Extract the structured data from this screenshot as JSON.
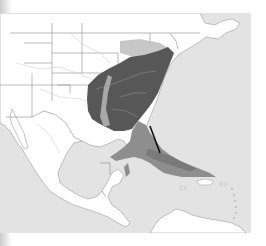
{
  "map": {
    "subject": "Species range map — eastern North America and Caribbean",
    "colors": {
      "ocean": "#e3e3e3",
      "land": "#ffffff",
      "border": "#9a9a9a",
      "river": "#c8c8c8",
      "breeding_range": "#575757",
      "wintering_range": "#8e8e8e",
      "migration_band": "#b5b5b5",
      "arrow": "#111111"
    },
    "legend": [],
    "regions": [
      {
        "name": "breeding-range",
        "area": "Eastern United States"
      },
      {
        "name": "wintering-range",
        "area": "Gulf of Mexico / Cuba / Bahamas"
      },
      {
        "name": "migration-arrow",
        "from": "Southeastern US",
        "to": "Cuba"
      }
    ]
  }
}
